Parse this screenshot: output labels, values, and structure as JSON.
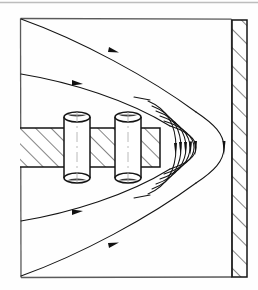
{
  "figure": {
    "title": "Magnetic field lines around a hatched core with two coils adjacent to a hatched wall",
    "background_color": "#fefefe",
    "ink_color": "#1a1a1a",
    "line_color": "#111111",
    "hatch_color": "#333333",
    "faint_color": "#9a9a9a"
  },
  "top_rule": {
    "name": "page-edge-rule",
    "color": "#b9b9b9",
    "y": 2,
    "x1": 0,
    "x2": 258
  },
  "frame": {
    "name": "diagram-frame",
    "left": 20,
    "top": 18,
    "right": 232,
    "bottom": 277,
    "color": "#4a4a4a"
  },
  "wall": {
    "name": "right-wall",
    "left": 232,
    "top": 20,
    "width": 15,
    "height": 257,
    "hatch_direction": "bottom-left-to-top-right",
    "hatch_spacing": 13,
    "color": "#1a1a1a"
  },
  "core": {
    "name": "magnetic-core-bar",
    "left": 20,
    "top": 128,
    "right": 160,
    "bottom": 167,
    "hatch_direction": "bottom-left-to-top-right",
    "hatch_spacing": 11,
    "color": "#1a1a1a"
  },
  "coils": [
    {
      "name": "coil-1",
      "center_x": 77,
      "top": 112,
      "bottom": 183,
      "width": 26,
      "ellipse_ry": 5,
      "fill": "#ffffff"
    },
    {
      "name": "coil-2",
      "center_x": 128,
      "top": 112,
      "bottom": 183,
      "width": 26,
      "ellipse_ry": 5,
      "fill": "#ffffff"
    }
  ],
  "field_lines": {
    "name": "magnetic-field-lines",
    "count_outer_straight": 4,
    "count_inner_bundle": 6,
    "arrow_direction": "rightward-then-downward",
    "description": "Nested U-shaped flux lines wrapping around the right tip of the core, straightening into diagonals toward the left frame edge"
  },
  "arrowheads": {
    "name": "flow-direction-arrowheads",
    "count": 10,
    "color": "#111111"
  }
}
